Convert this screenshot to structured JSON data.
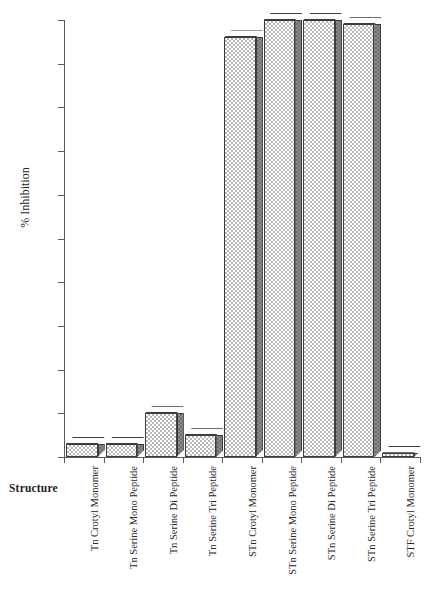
{
  "figure": {
    "structure_axis_label": "Structure",
    "background_color": "#ffffff",
    "axis_color": "#5a5a5a",
    "bar_front_color": "#d8d8d8",
    "bar_side_color": "#8c8c8c",
    "bar_top_color": "#fdfdfd"
  },
  "chart_data": {
    "type": "bar",
    "title": "",
    "xlabel": "Structure",
    "ylabel": "% Inhibition",
    "ylim": [
      0,
      100
    ],
    "yticks": [
      0,
      10,
      20,
      30,
      40,
      50,
      60,
      70,
      80,
      90,
      100
    ],
    "ytick_labels": [
      "0",
      "10",
      "20",
      "30",
      "40",
      "50",
      "60",
      "70",
      "80",
      "90",
      "100"
    ],
    "grid": false,
    "legend": "none",
    "style": "3d-block-bars",
    "categories": [
      "Tn Crotyl Monomer",
      "Tn Serine Mono Peptide",
      "Tn Serine Di Peptide",
      "Tn Serine Tri Peptide",
      "STn Crotyl Monomer",
      "STn Serine Mono Peptide",
      "STn Serine Di Peptide",
      "STn Serine Tri Peptide",
      "STF Crotyl Monomer"
    ],
    "values": [
      3,
      3,
      10,
      5,
      96,
      100,
      100,
      99,
      1
    ],
    "series": [
      {
        "name": "% Inhibition",
        "values": [
          3,
          3,
          10,
          5,
          96,
          100,
          100,
          99,
          1
        ]
      }
    ]
  }
}
